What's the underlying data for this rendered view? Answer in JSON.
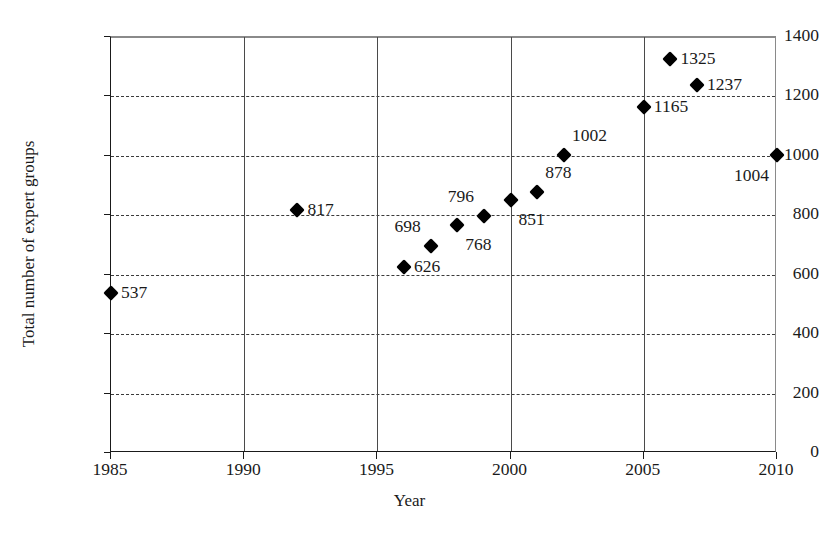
{
  "chart_data": {
    "type": "scatter",
    "title": "",
    "xlabel": "Year",
    "ylabel": "Total number of expert groups",
    "xlim": [
      1985,
      2010
    ],
    "ylim": [
      0,
      1400
    ],
    "xticks": [
      1985,
      1990,
      1995,
      2000,
      2005,
      2010
    ],
    "yticks": [
      0,
      200,
      400,
      600,
      800,
      1000,
      1200,
      1400
    ],
    "grid": "horizontal dashed, vertical solid",
    "legend": "none",
    "x": [
      1985,
      1992,
      1996,
      1997,
      1998,
      1999,
      2000,
      2001,
      2002,
      2005,
      2006,
      2007,
      2010
    ],
    "values": [
      537,
      817,
      626,
      698,
      768,
      796,
      851,
      878,
      1002,
      1165,
      1325,
      1237,
      1004
    ],
    "points": [
      {
        "year": 1985,
        "value": 537,
        "label": "537",
        "label_pos": "right"
      },
      {
        "year": 1992,
        "value": 817,
        "label": "817",
        "label_pos": "right"
      },
      {
        "year": 1996,
        "value": 626,
        "label": "626",
        "label_pos": "right"
      },
      {
        "year": 1997,
        "value": 698,
        "label": "698",
        "label_pos": "above-left"
      },
      {
        "year": 1998,
        "value": 768,
        "label": "768",
        "label_pos": "below-right"
      },
      {
        "year": 1999,
        "value": 796,
        "label": "796",
        "label_pos": "above-left"
      },
      {
        "year": 2000,
        "value": 851,
        "label": "851",
        "label_pos": "below-right"
      },
      {
        "year": 2001,
        "value": 878,
        "label": "878",
        "label_pos": "above-right"
      },
      {
        "year": 2002,
        "value": 1002,
        "label": "1002",
        "label_pos": "above-right"
      },
      {
        "year": 2005,
        "value": 1165,
        "label": "1165",
        "label_pos": "right"
      },
      {
        "year": 2006,
        "value": 1325,
        "label": "1325",
        "label_pos": "right"
      },
      {
        "year": 2007,
        "value": 1237,
        "label": "1237",
        "label_pos": "right"
      },
      {
        "year": 2010,
        "value": 1004,
        "label": "1004",
        "label_pos": "below-left"
      }
    ],
    "colors": {
      "marker": "#000000",
      "text": "#1a1a1a",
      "vertical_gridline": "#4a4a4a",
      "horizontal_gridline": "#3a3a3a",
      "axis": "#1a1a1a",
      "background": "#ffffff"
    }
  }
}
